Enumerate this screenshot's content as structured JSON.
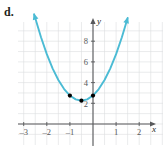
{
  "figure": {
    "part_label": "d."
  },
  "chart_data": {
    "type": "line",
    "title": "",
    "subtitle": "",
    "xlabel": "x",
    "ylabel": "y",
    "xlim": [
      -3.55,
      2.65
    ],
    "ylim": [
      -1.1,
      10.2
    ],
    "xticks": [
      -3,
      -2,
      -1,
      1,
      2
    ],
    "xtick_labels": [
      "–3",
      "–2",
      "–1",
      "1",
      "2"
    ],
    "yticks": [
      2,
      4,
      6,
      8
    ],
    "ytick_labels": [
      "2",
      "4",
      "6",
      "8"
    ],
    "grid": true,
    "grid_color": "#dcdddf",
    "axis_color": "#58595b",
    "legend": null,
    "curve_color": "#4bbbd4",
    "point_color": "#000000",
    "series": [
      {
        "name": "parabola",
        "type": "curve",
        "description": "upward opening parabola with arrowheads at both ends",
        "equation_vertex": [
          -0.5,
          2.25
        ],
        "leading_coefficient": 2.0,
        "x_start": -2.55,
        "x_end": 1.75,
        "arrow_start": true,
        "arrow_end": true,
        "points": [
          [
            -2.55,
            10.6
          ],
          [
            -2.25,
            8.38
          ],
          [
            -2.0,
            6.75
          ],
          [
            -1.75,
            5.38
          ],
          [
            -1.5,
            4.25
          ],
          [
            -1.25,
            3.38
          ],
          [
            -1.0,
            2.75
          ],
          [
            -0.75,
            2.38
          ],
          [
            -0.5,
            2.25
          ],
          [
            -0.25,
            2.38
          ],
          [
            0.0,
            2.75
          ],
          [
            0.25,
            3.38
          ],
          [
            0.5,
            4.25
          ],
          [
            0.75,
            5.38
          ],
          [
            1.0,
            6.75
          ],
          [
            1.25,
            8.38
          ],
          [
            1.5,
            10.25
          ]
        ]
      },
      {
        "name": "marked-points",
        "type": "scatter",
        "values": [
          [
            -1.0,
            2.75
          ],
          [
            -0.5,
            2.25
          ],
          [
            0.0,
            2.75
          ]
        ]
      }
    ]
  }
}
